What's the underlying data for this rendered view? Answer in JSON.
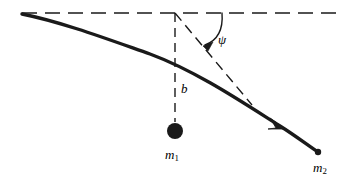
{
  "figure": {
    "type": "scattering-trajectory-diagram",
    "background_color": "#ffffff",
    "stroke_color": "#1a1a1a",
    "labels": {
      "psi": "ψ",
      "impact_parameter": "b",
      "mass_target": "m",
      "mass_target_sub": "1",
      "mass_projectile": "m",
      "mass_projectile_sub": "2"
    },
    "elements": {
      "asymptote_horizontal_name": "incoming-asymptote-dashed-line",
      "asymptote_outgoing_name": "outgoing-asymptote-dashed-line",
      "impact_parameter_line_name": "impact-parameter-dashed-line",
      "trajectory_name": "scattering-trajectory-curve",
      "angle_arc_name": "scattering-angle-arc",
      "target_particle_name": "target-particle-dot",
      "projectile_end_name": "projectile-end-dot"
    },
    "geometry": {
      "horizontal_dashed_y": 13,
      "horizontal_dashed_x_start": 22,
      "horizontal_dashed_x_end": 338,
      "vertical_dashed_x": 175,
      "vertical_dashed_y_start": 13,
      "vertical_dashed_y_end": 122,
      "target_dot_cx": 175,
      "target_dot_cy": 131,
      "target_dot_r": 8,
      "trajectory_start": [
        22,
        14
      ],
      "trajectory_end": [
        318,
        152
      ],
      "projectile_dot_r": 3,
      "arrow_on_trajectory": [
        279,
        124
      ],
      "arc_start": [
        222,
        13
      ],
      "arc_end": [
        203,
        46
      ],
      "outgoing_asymptote_start": [
        175,
        13
      ],
      "outgoing_asymptote_end": [
        252,
        105
      ]
    }
  }
}
